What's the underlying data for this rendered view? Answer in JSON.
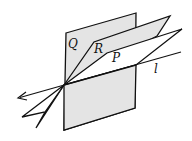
{
  "diagram": {
    "labels": {
      "plane_q": "Q",
      "plane_r": "R",
      "plane_p": "P",
      "line_l": "l"
    },
    "colors": {
      "plane_fill": "#e4e4e4",
      "plane_p_fill": "#ffffff",
      "stroke": "#111111"
    }
  }
}
